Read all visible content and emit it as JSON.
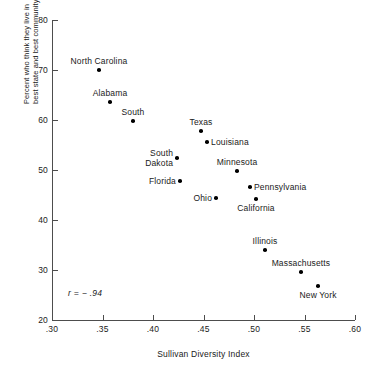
{
  "chart_data": {
    "type": "scatter",
    "title": "",
    "xlabel": "Sullivan Diversity Index",
    "ylabel_lines": [
      "Percent who think they live in",
      "best state and best community"
    ],
    "xlim": [
      0.3,
      0.6
    ],
    "ylim": [
      20,
      80
    ],
    "xticks": [
      ".30",
      ".35",
      ".40",
      ".45",
      ".50",
      ".55",
      ".60"
    ],
    "xtick_values": [
      0.3,
      0.35,
      0.4,
      0.45,
      0.5,
      0.55,
      0.6
    ],
    "yticks": [
      "20",
      "30",
      "40",
      "50",
      "60",
      "70",
      "80"
    ],
    "ytick_values": [
      20,
      30,
      40,
      50,
      60,
      70,
      80
    ],
    "grid": false,
    "legend": false,
    "annotations": [
      {
        "name": "correlation",
        "text": "r = − .94",
        "x": 0.316,
        "y": 25.6
      }
    ],
    "points": [
      {
        "label": "North Carolina",
        "x": 0.3465,
        "y": 70.0,
        "label_pos": "above"
      },
      {
        "label": "Alabama",
        "x": 0.3574,
        "y": 63.6,
        "label_pos": "above"
      },
      {
        "label": "South",
        "x": 0.3802,
        "y": 59.8,
        "label_pos": "above"
      },
      {
        "label": "South\nDakota",
        "x": 0.4238,
        "y": 52.4,
        "label_pos": "left"
      },
      {
        "label": "Florida",
        "x": 0.4267,
        "y": 47.8,
        "label_pos": "left"
      },
      {
        "label": "Texas",
        "x": 0.4475,
        "y": 57.8,
        "label_pos": "above"
      },
      {
        "label": "Louisiana",
        "x": 0.4535,
        "y": 55.6,
        "label_pos": "right"
      },
      {
        "label": "Minnesota",
        "x": 0.4832,
        "y": 49.8,
        "label_pos": "above"
      },
      {
        "label": "Ohio",
        "x": 0.4624,
        "y": 44.4,
        "label_pos": "left"
      },
      {
        "label": "Pennsylvania",
        "x": 0.496,
        "y": 46.6,
        "label_pos": "right"
      },
      {
        "label": "California",
        "x": 0.502,
        "y": 44.2,
        "label_pos": "below"
      },
      {
        "label": "Illinois",
        "x": 0.5109,
        "y": 34.0,
        "label_pos": "above"
      },
      {
        "label": "Massachusetts",
        "x": 0.5465,
        "y": 29.6,
        "label_pos": "above"
      },
      {
        "label": "New York",
        "x": 0.5634,
        "y": 26.8,
        "label_pos": "below"
      }
    ],
    "colors": {
      "point": "#000000",
      "axis": "#4d4d4d",
      "text": "#1a1a1a",
      "background": "#ffffff"
    }
  },
  "footer": {
    "partial_text": ""
  }
}
